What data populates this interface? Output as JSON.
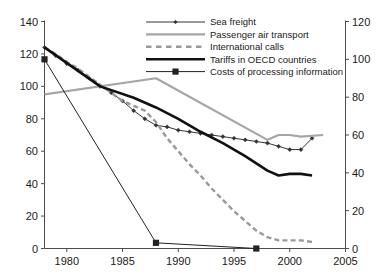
{
  "chart_data": {
    "type": "line",
    "title": "",
    "subtitle": "",
    "xlabel": "",
    "ylabel": "",
    "y2label": "",
    "xlim": [
      1978,
      2005
    ],
    "ylim": [
      0,
      140
    ],
    "y2lim": [
      0,
      120
    ],
    "grid": false,
    "legend_position": "top-center",
    "xticks": [
      "1980",
      "1985",
      "1990",
      "1995",
      "2000",
      "2005"
    ],
    "xtick_values": [
      1980,
      1985,
      1990,
      1995,
      2000,
      2005
    ],
    "yticks": [
      "0",
      "20",
      "40",
      "60",
      "80",
      "100",
      "120",
      "140"
    ],
    "ytick_values": [
      0,
      20,
      40,
      60,
      80,
      100,
      120,
      140
    ],
    "y2ticks": [
      "0",
      "20",
      "40",
      "60",
      "80",
      "100",
      "120"
    ],
    "y2tick_values": [
      0,
      20,
      40,
      60,
      80,
      100,
      120
    ],
    "series": [
      {
        "name": "Sea freight",
        "axis": "left",
        "color": "#333333",
        "style": "solid-thin-diamond-markers",
        "x": [
          1978,
          1979,
          1980,
          1981,
          1982,
          1983,
          1984,
          1985,
          1986,
          1987,
          1988,
          1989,
          1990,
          1991,
          1992,
          1993,
          1994,
          1995,
          1996,
          1997,
          1998,
          1999,
          2000,
          2001,
          2002
        ],
        "values": [
          124,
          119,
          114,
          110,
          105,
          100,
          96,
          91,
          85,
          80,
          76,
          75,
          73,
          72,
          71,
          70,
          69,
          68,
          67,
          66,
          65,
          63,
          61,
          61,
          68
        ]
      },
      {
        "name": "Passenger air transport",
        "axis": "left",
        "color": "#a6a6a6",
        "style": "solid-thick",
        "x": [
          1978,
          1988,
          1998,
          1999,
          2000,
          2001,
          2003
        ],
        "values": [
          95,
          105,
          67,
          70,
          70,
          69,
          70
        ]
      },
      {
        "name": "International calls",
        "axis": "left",
        "color": "#999999",
        "style": "dashed-thick",
        "x": [
          1978,
          1979,
          1980,
          1981,
          1982,
          1983,
          1984,
          1985,
          1986,
          1987,
          1988,
          1989,
          1990,
          1991,
          1992,
          1993,
          1994,
          1995,
          1996,
          1997,
          1998,
          1999,
          2000,
          2001,
          2002
        ],
        "values": [
          124,
          120,
          115,
          111,
          106,
          101,
          96,
          91,
          88,
          85,
          78,
          68,
          60,
          52,
          45,
          37,
          30,
          23,
          17,
          11,
          7,
          5,
          5,
          5,
          4
        ]
      },
      {
        "name": "Tariffs in OECD countries",
        "axis": "left",
        "color": "#111111",
        "style": "solid-extra-thick",
        "x": [
          1978,
          1983,
          1986,
          1988,
          1990,
          1992,
          1994,
          1996,
          1998,
          1999,
          2000,
          2001,
          2002
        ],
        "values": [
          124,
          100,
          93,
          87,
          80,
          72,
          65,
          57,
          48,
          45,
          46,
          46,
          45
        ]
      },
      {
        "name": "Costs of processing information",
        "axis": "right",
        "color": "#222222",
        "style": "solid-thin-square-markers",
        "x": [
          1978,
          1988,
          1997
        ],
        "values": [
          100,
          3,
          0
        ]
      }
    ]
  },
  "legend": {
    "items": [
      {
        "label": "Sea freight"
      },
      {
        "label": "Passenger air transport"
      },
      {
        "label": "International calls"
      },
      {
        "label": "Tariffs in OECD countries"
      },
      {
        "label": "Costs of processing information"
      }
    ]
  },
  "axes": {
    "left": {
      "ticks": [
        "140",
        "120",
        "100",
        "80",
        "60",
        "40",
        "20",
        "0"
      ]
    },
    "right": {
      "ticks": [
        "120",
        "100",
        "80",
        "60",
        "40",
        "20",
        "0"
      ]
    },
    "bottom": {
      "ticks": [
        "1980",
        "1985",
        "1990",
        "1995",
        "2000",
        "2005"
      ]
    }
  }
}
